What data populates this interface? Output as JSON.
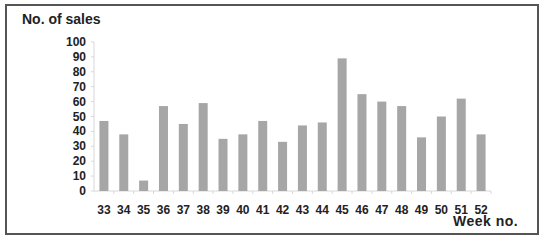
{
  "chart_data": {
    "type": "bar",
    "title": "",
    "ylabel": "No. of sales",
    "xlabel": "Week no.",
    "categories": [
      "33",
      "34",
      "35",
      "36",
      "37",
      "38",
      "39",
      "40",
      "41",
      "42",
      "43",
      "44",
      "45",
      "46",
      "47",
      "48",
      "49",
      "50",
      "51",
      "52"
    ],
    "series": [
      {
        "name": "No. of sales",
        "values": [
          47,
          38,
          7,
          57,
          45,
          59,
          35,
          38,
          47,
          33,
          44,
          46,
          89,
          65,
          60,
          57,
          36,
          50,
          62,
          38
        ],
        "color": "#a6a6a6"
      }
    ],
    "ylim": [
      0,
      100
    ],
    "yticks": [
      0,
      10,
      20,
      30,
      40,
      50,
      60,
      70,
      80,
      90,
      100
    ],
    "grid": false,
    "legend": "none"
  }
}
